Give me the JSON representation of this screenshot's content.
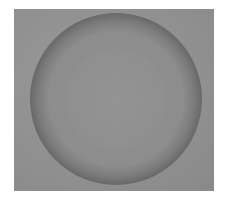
{
  "image": {
    "description": "Grayscale photograph of a circular dark ring on a gray background",
    "colors": {
      "background": "#8e8e8e",
      "ring": "#6a6a6a",
      "center": "#969696",
      "page": "#ffffff"
    }
  }
}
